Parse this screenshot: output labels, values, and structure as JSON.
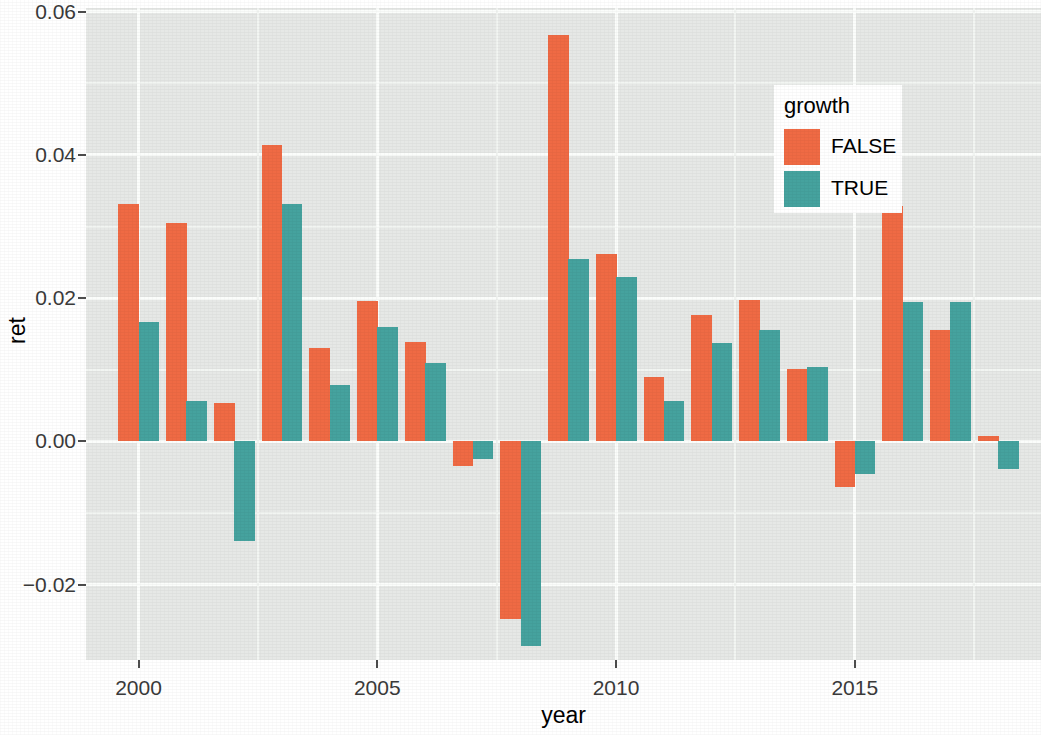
{
  "chart_data": {
    "type": "bar",
    "title": "",
    "xlabel": "year",
    "ylabel": "ret",
    "legend_title": "growth",
    "legend_position": "inside-top-right",
    "grid": true,
    "xlim": [
      1998.9,
      2018.9
    ],
    "ylim": [
      -0.0305,
      0.0605
    ],
    "x_ticks": [
      2000,
      2005,
      2010,
      2015
    ],
    "x_tick_labels": [
      "2000",
      "2005",
      "2010",
      "2015"
    ],
    "y_ticks": [
      -0.02,
      0.0,
      0.02,
      0.04,
      0.06
    ],
    "y_tick_labels": [
      "-0.02",
      "0.00",
      "0.02",
      "0.04",
      "0.06"
    ],
    "categories": [
      1999,
      2000,
      2001,
      2002,
      2003,
      2004,
      2005,
      2006,
      2007,
      2008,
      2009,
      2010,
      2011,
      2012,
      2013,
      2014,
      2015,
      2016,
      2017,
      2018
    ],
    "series": [
      {
        "name": "FALSE",
        "color": "#ef6a44",
        "values": [
          null,
          0.0331,
          0.0305,
          0.0054,
          0.0414,
          0.013,
          0.0196,
          0.0139,
          -0.0034,
          -0.0248,
          0.0568,
          0.0262,
          0.009,
          0.0176,
          0.0198,
          0.0101,
          -0.0063,
          0.0329,
          0.0155,
          0.0008
        ]
      },
      {
        "name": "TRUE",
        "color": "#45a29e",
        "values": [
          null,
          0.0167,
          0.0056,
          -0.0139,
          0.0331,
          0.0079,
          0.016,
          0.011,
          -0.0025,
          -0.0286,
          0.0255,
          0.0229,
          0.0056,
          0.0138,
          0.0156,
          0.0104,
          -0.0045,
          0.0194,
          0.0195,
          -0.0038
        ]
      }
    ]
  },
  "axes": {
    "y_title": "ret",
    "x_title": "year",
    "y_tick_labels": [
      "0.06",
      "0.04",
      "0.02",
      "0.00",
      "−0.02"
    ],
    "x_tick_labels": [
      "2000",
      "2005",
      "2010",
      "2015"
    ]
  },
  "legend": {
    "title": "growth",
    "items": [
      {
        "label": "FALSE",
        "color": "#ef6a44"
      },
      {
        "label": "TRUE",
        "color": "#45a29e"
      }
    ]
  },
  "theme": {
    "panel_background": "#e6e8e6",
    "grid_major": "#fbfdfb",
    "grid_minor": "#f2f5f2",
    "text_color": "#3a3a3a",
    "page_background": "#ffffff"
  }
}
